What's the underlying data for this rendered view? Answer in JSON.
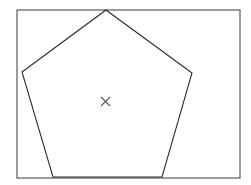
{
  "figure": {
    "background_color": "#ffffff",
    "canvas": {
      "width": 251,
      "height": 185
    }
  },
  "frame": {
    "name": "bounding-rectangle",
    "x": 17,
    "y": 10,
    "width": 223,
    "height": 168,
    "stroke_color": "#4a4a4a",
    "stroke_width": 1.1,
    "fill": "none"
  },
  "pentagon": {
    "name": "pentagon",
    "sides": 5,
    "stroke_color": "#262626",
    "stroke_width": 1.05,
    "fill": "none",
    "points_string": "106,10 192,73 162,177 53,177 22,72",
    "vertices": [
      {
        "label": "apex",
        "x": 106,
        "y": 10
      },
      {
        "label": "right",
        "x": 192,
        "y": 73
      },
      {
        "label": "bottom-right",
        "x": 162,
        "y": 177
      },
      {
        "label": "bottom-left",
        "x": 53,
        "y": 177
      },
      {
        "label": "left",
        "x": 22,
        "y": 72
      }
    ]
  },
  "center_marker": {
    "name": "center-cross",
    "glyph": "x-cross",
    "cx": 105.5,
    "cy": 101.5,
    "arm": 4.5,
    "stroke_color": "#595959",
    "stroke_width": 1.1,
    "line1": {
      "x1": 101,
      "y1": 97,
      "x2": 110,
      "y2": 106
    },
    "line2": {
      "x1": 110,
      "y1": 97,
      "x2": 101,
      "y2": 106
    }
  }
}
